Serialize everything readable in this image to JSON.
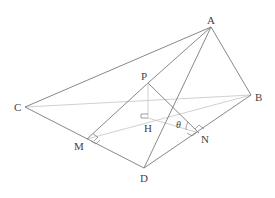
{
  "diagram": {
    "type": "3D geometry figure (pyramid with perpendicular foot and dihedral angle)",
    "colors": {
      "edge": "#7a7a7a",
      "hidden_edge": "#c4c4c4",
      "label": "#444444"
    },
    "points": {
      "A": {
        "label": "A",
        "x": 211,
        "y": 27
      },
      "B": {
        "label": "B",
        "x": 251,
        "y": 95
      },
      "C": {
        "label": "C",
        "x": 25,
        "y": 107
      },
      "D": {
        "label": "D",
        "x": 144,
        "y": 168
      },
      "P": {
        "label": "P",
        "x": 148,
        "y": 83
      },
      "H": {
        "label": "H",
        "x": 148,
        "y": 118
      },
      "M": {
        "label": "M",
        "x": 87,
        "y": 139
      },
      "N": {
        "label": "N",
        "x": 199,
        "y": 133
      }
    },
    "angle_label": "θ",
    "solid_edges": [
      "AC",
      "AB",
      "AD",
      "CD",
      "DB",
      "PM",
      "PN",
      "PA",
      "PH",
      "HN"
    ],
    "hidden_edges": [
      "CB",
      "MB",
      "HM"
    ],
    "right_angle_marks": [
      "PHM at H",
      "at M (PM ⟂ CD)",
      "at N (PN ⟂ DB)"
    ]
  }
}
